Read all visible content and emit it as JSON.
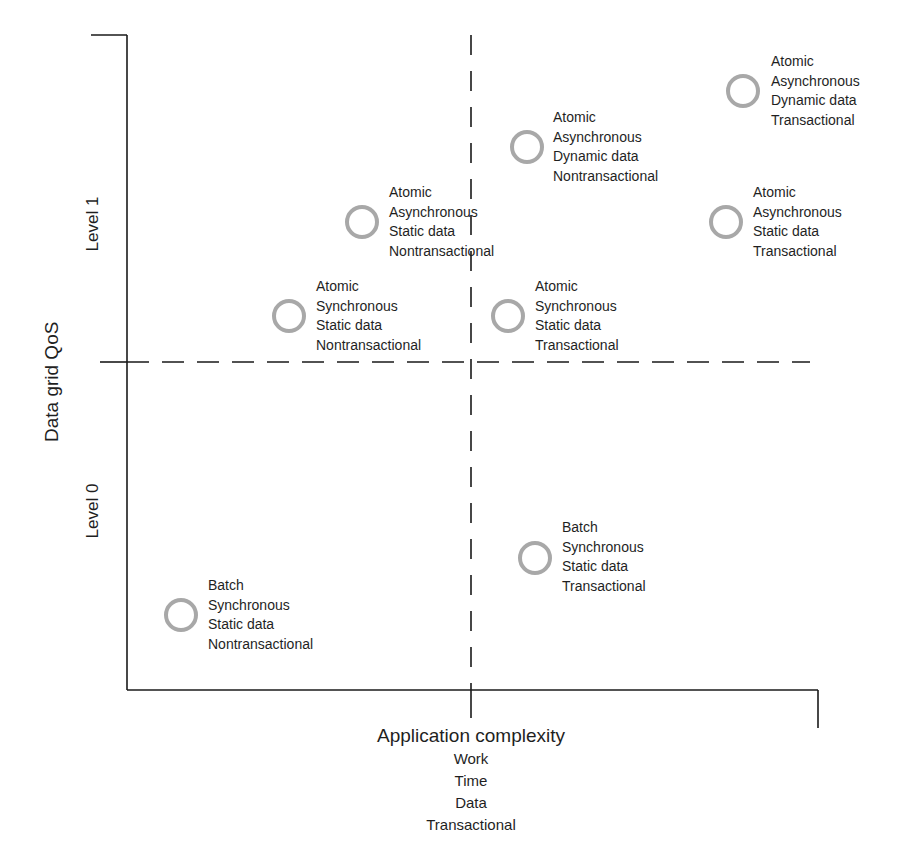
{
  "diagram": {
    "y_axis_title": "Data grid QoS",
    "y_levels": [
      "Level 1",
      "Level 0"
    ],
    "x_axis_title": "Application complexity",
    "x_axis_subtitles": [
      "Work",
      "Time",
      "Data",
      "Transactional"
    ],
    "circle_color": "#a8a8a8",
    "line_color": "#1a1a1a",
    "points": [
      {
        "id": "p1",
        "lines": [
          "Atomic",
          "Asynchronous",
          "Dynamic data",
          "Transactional"
        ],
        "cx": 743,
        "cy": 91,
        "lx": 771,
        "ly": 52
      },
      {
        "id": "p2",
        "lines": [
          "Atomic",
          "Asynchronous",
          "Dynamic data",
          "Nontransactional"
        ],
        "cx": 527,
        "cy": 147,
        "lx": 553,
        "ly": 108
      },
      {
        "id": "p3",
        "lines": [
          "Atomic",
          "Asynchronous",
          "Static data",
          "Nontransactional"
        ],
        "cx": 362,
        "cy": 222,
        "lx": 389,
        "ly": 183
      },
      {
        "id": "p4",
        "lines": [
          "Atomic",
          "Asynchronous",
          "Static data",
          "Transactional"
        ],
        "cx": 726,
        "cy": 222,
        "lx": 753,
        "ly": 183
      },
      {
        "id": "p5",
        "lines": [
          "Atomic",
          "Synchronous",
          "Static data",
          "Nontransactional"
        ],
        "cx": 289,
        "cy": 316,
        "lx": 316,
        "ly": 277
      },
      {
        "id": "p6",
        "lines": [
          "Atomic",
          "Synchronous",
          "Static data",
          "Transactional"
        ],
        "cx": 508,
        "cy": 316,
        "lx": 535,
        "ly": 277
      },
      {
        "id": "p7",
        "lines": [
          "Batch",
          "Synchronous",
          "Static data",
          "Transactional"
        ],
        "cx": 535,
        "cy": 558,
        "lx": 562,
        "ly": 518
      },
      {
        "id": "p8",
        "lines": [
          "Batch",
          "Synchronous",
          "Static data",
          "Nontransactional"
        ],
        "cx": 181,
        "cy": 615,
        "lx": 208,
        "ly": 576
      }
    ]
  }
}
